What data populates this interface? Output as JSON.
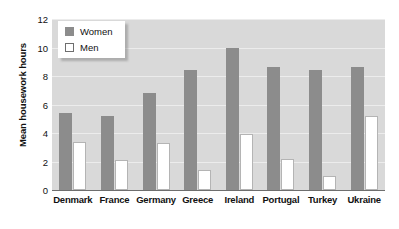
{
  "chart_data": {
    "type": "bar",
    "title": "",
    "xlabel": "",
    "ylabel": "Mean housework hours",
    "ylim": [
      0,
      12
    ],
    "yticks": [
      0,
      2,
      4,
      6,
      8,
      10,
      12
    ],
    "grid": true,
    "legend_position": "top-left",
    "categories": [
      "Denmark",
      "France",
      "Germany",
      "Greece",
      "Ireland",
      "Portugal",
      "Turkey",
      "Ukraine"
    ],
    "series": [
      {
        "name": "Women",
        "color": "#8c8c8c",
        "values": [
          5.4,
          5.2,
          6.8,
          8.4,
          10.0,
          8.6,
          8.4,
          8.6
        ]
      },
      {
        "name": "Men",
        "color": "#ffffff",
        "values": [
          3.4,
          2.1,
          3.3,
          1.4,
          3.9,
          2.2,
          1.0,
          5.2
        ]
      }
    ]
  },
  "colors": {
    "plot_background": "#d9d9d9",
    "gridline": "#ececec",
    "axis": "#6e6e6e",
    "women_bar": "#8c8c8c",
    "men_bar": "#ffffff",
    "men_bar_border": "#b4b4b4",
    "text": "#111111"
  }
}
